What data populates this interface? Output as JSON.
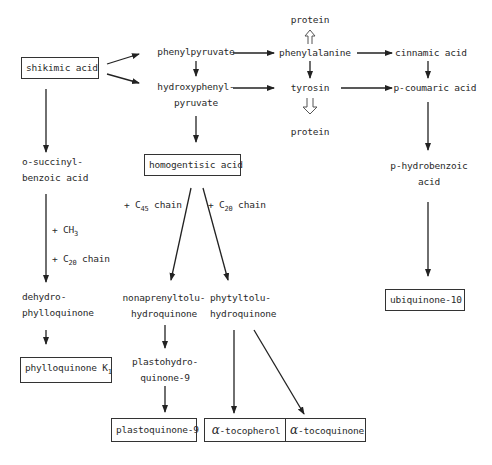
{
  "diagram": {
    "nodes": {
      "shikimic_acid": "shikimic acid",
      "phenylpyruvate": "phenylpyruvate",
      "hydroxyphenylpyruvate_1": "hydroxyphenyl-",
      "hydroxyphenylpyruvate_2": "pyruvate",
      "protein_top": "protein",
      "phenylalanine": "phenylalanine",
      "tyrosin": "tyrosin",
      "protein_bottom": "protein",
      "cinnamic_acid": "cinnamic acid",
      "p_coumaric_acid": "p-coumaric acid",
      "o_succinyl_1": "o-succinyl-",
      "o_succinyl_2": "benzoic acid",
      "homogentisic_acid": "homogentisic acid",
      "p_hydrobenzoic_1": "p-hydrobenzoic",
      "p_hydrobenzoic_2": "acid",
      "dehydro_1": "dehydro-",
      "dehydro_2": "phylloquinone",
      "nonaprenyl_1": "nonaprenyltolu-",
      "nonaprenyl_2": "hydroquinone",
      "phytyl_1": "phytyltolu-",
      "phytyl_2": "hydroquinone",
      "ubiquinone": "ubiquinone-10",
      "phylloquinone": "phylloquinone K",
      "phylloquinone_sub": "1",
      "plastohydro_1": "plastohydro-",
      "plastohydro_2": "quinone-9",
      "plastoquinone": "plastoquinone-9",
      "alpha_symbol": "α",
      "tocopherol": "-tocopherol",
      "tocoquinone": "-tocoquinone"
    },
    "edge_labels": {
      "c45_prefix": "+ C",
      "c45_sub": "45",
      "c45_suffix": " chain",
      "c20_prefix": "+ C",
      "c20_sub": "20",
      "c20_suffix": " chain",
      "ch3_prefix": "+ CH",
      "ch3_sub": "3",
      "c20b_prefix": "+ C",
      "c20b_sub": "20",
      "c20b_suffix": " chain"
    }
  }
}
